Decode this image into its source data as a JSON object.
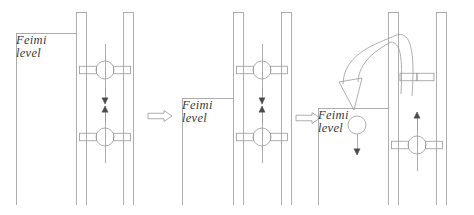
{
  "figure": {
    "stroke_color": "#9a9a9a",
    "text_color": "#3a3a3a",
    "background": "#ffffff",
    "line_width": 0.8
  },
  "panels": [
    {
      "id": "panel-1",
      "fermi_label": "Feimi\nlevel",
      "fermi_label_x": 16,
      "fermi_label_y": 34,
      "fermi_line": {
        "x1": 16,
        "x2": 76,
        "y": 33
      },
      "bands": [
        {
          "name": "band-left-outer",
          "x": 16,
          "y1": 33,
          "y2": 205
        },
        {
          "name": "band-mid-left",
          "x": 76,
          "y1": 12,
          "y2": 205
        },
        {
          "name": "band-mid-right",
          "x": 86,
          "y1": 12,
          "y2": 205
        },
        {
          "name": "band-right-left",
          "x": 123,
          "y1": 12,
          "y2": 205
        },
        {
          "name": "band-right-outer",
          "x": 133,
          "y1": 12,
          "y2": 205
        }
      ],
      "band_tops": [
        {
          "name": "band-top-mid",
          "x1": 76,
          "x2": 86,
          "y": 12
        },
        {
          "name": "band-top-right",
          "x1": 123,
          "x2": 133,
          "y": 12
        }
      ],
      "spins": [
        {
          "name": "spin-upper",
          "cx": 105,
          "cy": 70,
          "r": 9,
          "bars": true,
          "axis": true
        },
        {
          "name": "spin-lower",
          "cx": 105,
          "cy": 137,
          "r": 9,
          "bars": true,
          "axis": true
        }
      ],
      "arrows": [
        {
          "name": "arrow-down",
          "x": 105,
          "y1": 88,
          "y2": 104,
          "dir": "down"
        },
        {
          "name": "arrow-up",
          "x": 105,
          "y1": 122,
          "y2": 106,
          "dir": "up"
        }
      ]
    },
    {
      "id": "panel-2",
      "fermi_label": "Feimi\nlevel",
      "fermi_label_x": 182,
      "fermi_label_y": 99,
      "fermi_line": {
        "x1": 182,
        "x2": 233,
        "y": 98
      },
      "bands": [
        {
          "name": "band-left-outer",
          "x": 182,
          "y1": 98,
          "y2": 205
        },
        {
          "name": "band-mid-left",
          "x": 233,
          "y1": 12,
          "y2": 205
        },
        {
          "name": "band-mid-right",
          "x": 243,
          "y1": 12,
          "y2": 205
        },
        {
          "name": "band-right-left",
          "x": 281,
          "y1": 12,
          "y2": 205
        },
        {
          "name": "band-right-outer",
          "x": 291,
          "y1": 12,
          "y2": 205
        }
      ],
      "band_tops": [
        {
          "name": "band-top-mid",
          "x1": 233,
          "x2": 243,
          "y": 12
        },
        {
          "name": "band-top-right",
          "x1": 281,
          "x2": 291,
          "y": 12
        }
      ],
      "spins": [
        {
          "name": "spin-upper",
          "cx": 262,
          "cy": 70,
          "r": 9,
          "bars": true,
          "axis": true
        },
        {
          "name": "spin-lower",
          "cx": 262,
          "cy": 137,
          "r": 9,
          "bars": true,
          "axis": true
        }
      ],
      "arrows": [
        {
          "name": "arrow-down",
          "x": 262,
          "y1": 88,
          "y2": 104,
          "dir": "down"
        },
        {
          "name": "arrow-up",
          "x": 262,
          "y1": 122,
          "y2": 106,
          "dir": "up"
        }
      ]
    },
    {
      "id": "panel-3",
      "fermi_label": "Feimi\nlevel",
      "fermi_label_x": 318,
      "fermi_label_y": 109,
      "fermi_line": {
        "x1": 318,
        "x2": 388,
        "y": 108
      },
      "bands": [
        {
          "name": "band-left-outer",
          "x": 318,
          "y1": 108,
          "y2": 205
        },
        {
          "name": "band-mid-left",
          "x": 388,
          "y1": 12,
          "y2": 205
        },
        {
          "name": "band-mid-right",
          "x": 398,
          "y1": 12,
          "y2": 205
        },
        {
          "name": "band-right-left",
          "x": 436,
          "y1": 12,
          "y2": 205
        },
        {
          "name": "band-right-outer",
          "x": 446,
          "y1": 12,
          "y2": 205
        }
      ],
      "band_tops": [
        {
          "name": "band-top-mid",
          "x1": 388,
          "x2": 398,
          "y": 12
        },
        {
          "name": "band-top-right",
          "x1": 436,
          "x2": 446,
          "y": 12
        }
      ],
      "spins": [
        {
          "name": "spin-transferred-electron",
          "cx": 357,
          "cy": 125,
          "r": 9,
          "bars": false,
          "axis": false
        },
        {
          "name": "spin-upper-right-bars",
          "cx": 417,
          "cy": 77,
          "r": 0,
          "bars": true,
          "axis": false
        },
        {
          "name": "spin-lower-right",
          "cx": 417,
          "cy": 145,
          "r": 9,
          "bars": true,
          "axis": true
        }
      ],
      "arrows": [
        {
          "name": "arrow-down-transferred",
          "x": 357,
          "y1": 134,
          "y2": 155,
          "dir": "down"
        },
        {
          "name": "arrow-up-right",
          "x": 417,
          "y1": 130,
          "y2": 112,
          "dir": "up"
        }
      ],
      "curved_arrow": {
        "name": "spin-flip-curved-arrow",
        "start_x": 412,
        "start_y": 96,
        "apex_x": 392,
        "apex_y": 38,
        "end_x": 357,
        "end_y": 92,
        "direction": "counterclockwise-down-left"
      }
    }
  ],
  "transitions": [
    {
      "name": "transition-arrow-1",
      "x": 148,
      "y": 116,
      "label": ""
    },
    {
      "name": "transition-arrow-2",
      "x": 296,
      "y": 118,
      "label": ""
    }
  ],
  "legend": {
    "spin_symbol_name": "electron-spin-state",
    "circle_meaning": "electron",
    "bar_meaning": "energy-band-level",
    "arrow_meaning": "spin-direction"
  }
}
